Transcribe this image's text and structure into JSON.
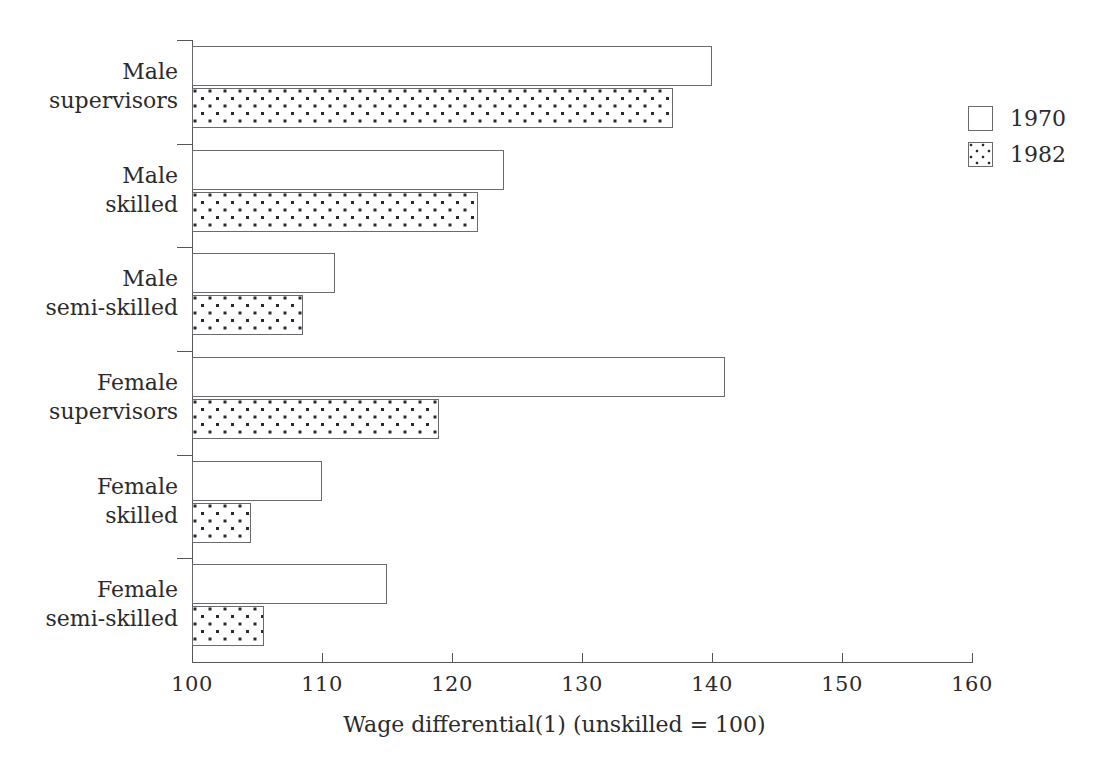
{
  "chart_data": {
    "type": "bar",
    "orientation": "horizontal",
    "title": "",
    "xlabel": "Wage differential(1) (unskilled = 100)",
    "ylabel": "",
    "xlim": [
      100,
      160
    ],
    "xticks": [
      100,
      110,
      120,
      130,
      140,
      150,
      160
    ],
    "xtick_labels": [
      "100",
      "110",
      "120",
      "130",
      "140",
      "150",
      "160"
    ],
    "grid": false,
    "legend_position": "right",
    "categories": [
      "Male\nsupervisors",
      "Male\nskilled",
      "Male\nsemi-skilled",
      "Female\nsupervisors",
      "Female\nskilled",
      "Female\nsemi-skilled"
    ],
    "series": [
      {
        "name": "1970",
        "fill": "white",
        "values": [
          140,
          124,
          111,
          141,
          110,
          115
        ]
      },
      {
        "name": "1982",
        "fill": "dotted",
        "values": [
          137,
          122,
          108.5,
          119,
          104.5,
          105.5
        ]
      }
    ]
  },
  "legend": {
    "entries": [
      {
        "label": "1970",
        "pattern": "empty"
      },
      {
        "label": "1982",
        "pattern": "dotted"
      }
    ]
  },
  "colors": {
    "background": "#ffffff",
    "axis": "#55565a",
    "bar_outline": "#6a6a6e",
    "bar_fill": "#ffffff",
    "dot": "#2a2a2a",
    "text": "#2b2b2b"
  }
}
